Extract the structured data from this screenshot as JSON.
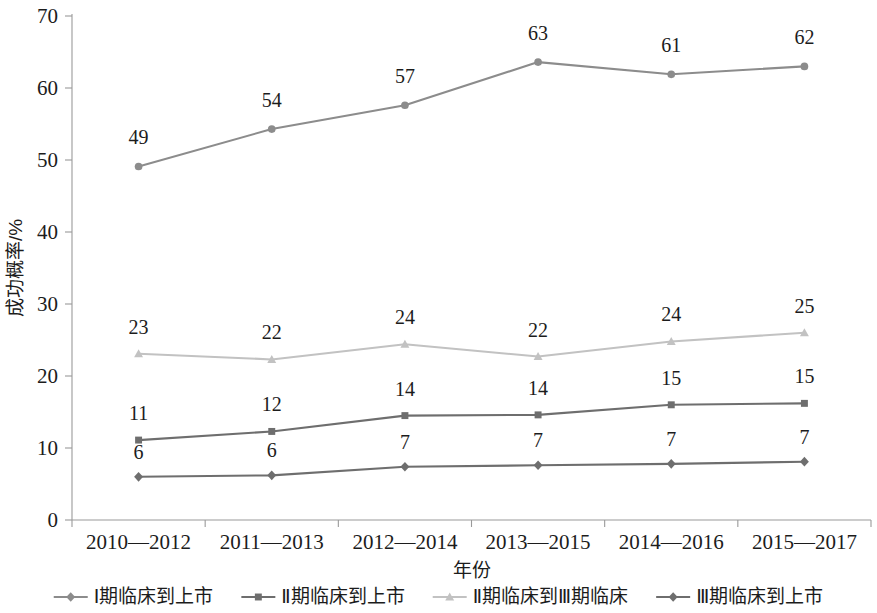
{
  "chart_data": {
    "type": "line",
    "title": "",
    "xlabel": "年份",
    "ylabel": "成功概率/%",
    "ylim": [
      0,
      70
    ],
    "yticks": [
      0,
      10,
      20,
      30,
      40,
      50,
      60,
      70
    ],
    "grid": false,
    "legend_position": "bottom",
    "categories": [
      "2010—2012",
      "2011—2013",
      "2012—2014",
      "2013—2015",
      "2014—2016",
      "2015—2017"
    ],
    "series": [
      {
        "name": "Ⅰ期临床到上市",
        "marker": "circle",
        "color": "#8c8c8c",
        "values": [
          49,
          54,
          57,
          63,
          61,
          62
        ],
        "plotted": [
          49.1,
          54.3,
          57.6,
          63.6,
          61.9,
          63.0
        ],
        "label_offset": -22
      },
      {
        "name": "Ⅱ期临床到上市",
        "marker": "square",
        "color": "#6e6e6e",
        "values": [
          11,
          12,
          14,
          14,
          15,
          15
        ],
        "plotted": [
          11.1,
          12.3,
          14.5,
          14.6,
          16.0,
          16.2
        ],
        "label_offset": -20
      },
      {
        "name": "Ⅱ期临床到Ⅲ期临床",
        "marker": "triangle",
        "color": "#c2c2c2",
        "values": [
          23,
          22,
          24,
          22,
          24,
          25
        ],
        "plotted": [
          23.1,
          22.3,
          24.4,
          22.7,
          24.8,
          26.0
        ],
        "label_offset": -20
      },
      {
        "name": "Ⅲ期临床到上市",
        "marker": "diamond",
        "color": "#6e6e6e",
        "values": [
          6,
          6,
          7,
          7,
          7,
          7
        ],
        "plotted": [
          6.0,
          6.2,
          7.4,
          7.6,
          7.8,
          8.1
        ],
        "label_offset": -18
      }
    ]
  },
  "axis": {
    "y_title": "成功概率/%",
    "x_title": "年份",
    "y_tick_labels": [
      "0",
      "10",
      "20",
      "30",
      "40",
      "50",
      "60",
      "70"
    ],
    "x_tick_labels": [
      "2010—2012",
      "2011—2013",
      "2012—2014",
      "2013—2015",
      "2014—2016",
      "2015—2017"
    ]
  },
  "legend": {
    "items": [
      {
        "label": "Ⅰ期临床到上市",
        "marker": "diamond",
        "color": "#8c8c8c"
      },
      {
        "label": "Ⅱ期临床到上市",
        "marker": "square",
        "color": "#6e6e6e"
      },
      {
        "label": "Ⅱ期临床到Ⅲ期临床",
        "marker": "triangle",
        "color": "#c2c2c2"
      },
      {
        "label": "Ⅲ期临床到上市",
        "marker": "diamond",
        "color": "#6e6e6e"
      }
    ]
  }
}
